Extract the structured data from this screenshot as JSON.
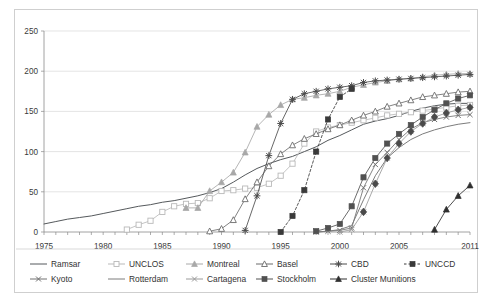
{
  "figure": {
    "background_color": "#ffffff",
    "frame_color": "#cfcfcf",
    "grid_color": "#d9d9d9",
    "axis_color": "#8a8a8a"
  },
  "chart_data": {
    "type": "line",
    "title": "",
    "subtitle": "",
    "xlabel": "",
    "ylabel": "",
    "xlim": [
      1975,
      2011
    ],
    "ylim": [
      0,
      250
    ],
    "ytick_values": [
      0,
      50,
      100,
      150,
      200,
      250
    ],
    "ytick_labels": [
      "0",
      "50",
      "100",
      "150",
      "200",
      "250"
    ],
    "xtick_values": [
      1975,
      1980,
      1985,
      1990,
      1995,
      2000,
      2005,
      2011
    ],
    "xtick_labels": [
      "1975",
      "1980",
      "1985",
      "1990",
      "1995",
      "2000",
      "2005",
      "2011"
    ],
    "grid": "horizontal",
    "legend_position": "bottom",
    "series": [
      {
        "name": "Ramsar",
        "color": "#55595c",
        "marker": "none",
        "dash": "none",
        "x": [
          1975,
          1976,
          1977,
          1978,
          1979,
          1980,
          1981,
          1982,
          1983,
          1984,
          1985,
          1986,
          1987,
          1988,
          1989,
          1990,
          1991,
          1992,
          1993,
          1994,
          1995,
          1996,
          1997,
          1998,
          1999,
          2000,
          2001,
          2002,
          2003,
          2004,
          2005,
          2006,
          2007,
          2008,
          2009,
          2010,
          2011
        ],
        "y": [
          10,
          13,
          16,
          18,
          20,
          23,
          26,
          29,
          32,
          34,
          37,
          39,
          42,
          45,
          49,
          54,
          62,
          71,
          79,
          85,
          90,
          94,
          100,
          106,
          114,
          120,
          127,
          134,
          138,
          141,
          145,
          150,
          154,
          157,
          159,
          160,
          160
        ]
      },
      {
        "name": "UNCLOS",
        "color": "#b9b9b9",
        "marker": "square-open",
        "dash": "none",
        "x": [
          1982,
          1983,
          1984,
          1985,
          1986,
          1987,
          1988,
          1989,
          1990,
          1991,
          1992,
          1993,
          1994,
          1995,
          1996,
          1997,
          1998,
          1999,
          2000,
          2001,
          2002,
          2003,
          2004,
          2005,
          2006,
          2007,
          2008,
          2009,
          2010,
          2011
        ],
        "y": [
          3,
          9,
          14,
          25,
          32,
          35,
          36,
          42,
          51,
          52,
          54,
          55,
          60,
          70,
          85,
          110,
          125,
          130,
          133,
          136,
          139,
          142,
          145,
          147,
          149,
          151,
          153,
          155,
          157,
          158
        ]
      },
      {
        "name": "Montreal",
        "color": "#a8a8a8",
        "marker": "triangle-filled",
        "dash": "none",
        "x": [
          1987,
          1988,
          1989,
          1990,
          1991,
          1992,
          1993,
          1994,
          1995,
          1996,
          1997,
          1998,
          1999,
          2000,
          2001,
          2002,
          2003,
          2004,
          2005,
          2006,
          2007,
          2008,
          2009,
          2010,
          2011
        ],
        "y": [
          30,
          30,
          51,
          62,
          74,
          99,
          131,
          146,
          158,
          165,
          167,
          170,
          172,
          175,
          180,
          183,
          186,
          188,
          190,
          191,
          193,
          195,
          196,
          197,
          197
        ]
      },
      {
        "name": "Basel",
        "color": "#6b6b6b",
        "marker": "triangle-open",
        "dash": "none",
        "x": [
          1989,
          1990,
          1991,
          1992,
          1993,
          1994,
          1995,
          1996,
          1997,
          1998,
          1999,
          2000,
          2001,
          2002,
          2003,
          2004,
          2005,
          2006,
          2007,
          2008,
          2009,
          2010,
          2011
        ],
        "y": [
          1,
          4,
          15,
          41,
          62,
          82,
          97,
          108,
          116,
          122,
          128,
          133,
          139,
          145,
          150,
          156,
          160,
          164,
          168,
          170,
          172,
          174,
          175
        ]
      },
      {
        "name": "CBD",
        "color": "#4b4b4b",
        "marker": "star",
        "dash": "none",
        "x": [
          1992,
          1993,
          1994,
          1995,
          1996,
          1997,
          1998,
          1999,
          2000,
          2001,
          2002,
          2003,
          2004,
          2005,
          2006,
          2007,
          2008,
          2009,
          2010,
          2011
        ],
        "y": [
          2,
          45,
          95,
          135,
          165,
          172,
          175,
          178,
          180,
          182,
          186,
          188,
          189,
          190,
          191,
          192,
          193,
          194,
          195,
          196
        ]
      },
      {
        "name": "UNCCD",
        "color": "#3a3a3a",
        "marker": "square-filled",
        "dash": "dotted",
        "x": [
          1995,
          1996,
          1997,
          1998,
          1999,
          2000,
          2001
        ],
        "y": [
          0,
          20,
          52,
          100,
          140,
          168,
          178
        ]
      },
      {
        "name": "Kyoto",
        "color": "#707070",
        "marker": "x",
        "dash": "none",
        "x": [
          1998,
          1999,
          2000,
          2001,
          2002,
          2003,
          2004,
          2005,
          2006,
          2007,
          2008,
          2009,
          2010,
          2011
        ],
        "y": [
          0,
          1,
          2,
          5,
          55,
          84,
          99,
          115,
          128,
          136,
          140,
          143,
          145,
          146
        ]
      },
      {
        "name": "Rotterdam",
        "color": "#7c7c7c",
        "marker": "none",
        "dash": "none",
        "x": [
          1998,
          1999,
          2000,
          2001,
          2002,
          2003,
          2004,
          2005,
          2006,
          2007,
          2008,
          2009,
          2010,
          2011
        ],
        "y": [
          0,
          1,
          3,
          8,
          40,
          70,
          92,
          105,
          115,
          122,
          127,
          131,
          134,
          136
        ]
      },
      {
        "name": "Cartagena",
        "color": "#9a9a9a",
        "marker": "x",
        "dash": "none",
        "x": [
          2000,
          2001,
          2002,
          2003,
          2004,
          2005,
          2006,
          2007,
          2008,
          2009,
          2010,
          2011
        ],
        "y": [
          0,
          3,
          25,
          60,
          92,
          110,
          125,
          135,
          143,
          148,
          152,
          155
        ]
      },
      {
        "name": "Stockholm",
        "color": "#515151",
        "marker": "square-filled",
        "dash": "none",
        "x": [
          1998,
          1999,
          2000,
          2001,
          2002,
          2003,
          2004,
          2005,
          2006,
          2007,
          2008,
          2009,
          2010,
          2011
        ],
        "y": [
          1,
          5,
          10,
          32,
          68,
          92,
          110,
          122,
          133,
          143,
          152,
          160,
          166,
          170
        ]
      },
      {
        "name": "Cluster Munitions",
        "color": "#2f2f2f",
        "marker": "triangle-filled",
        "dash": "none",
        "x": [
          2008,
          2009,
          2010,
          2011
        ],
        "y": [
          3,
          28,
          45,
          58
        ]
      }
    ],
    "extra_diamond_series": {
      "name": "Cartagena",
      "color": "#4a4a4a",
      "marker": "diamond-filled"
    }
  },
  "legend": {
    "rows": [
      [
        {
          "label": "Ramsar",
          "series": 0
        },
        {
          "label": "UNCLOS",
          "series": 1
        },
        {
          "label": "Montreal",
          "series": 2
        },
        {
          "label": "Basel",
          "series": 3
        },
        {
          "label": "CBD",
          "series": 4
        },
        {
          "label": "UNCCD",
          "series": 5
        }
      ],
      [
        {
          "label": "Kyoto",
          "series": 6
        },
        {
          "label": "Rotterdam",
          "series": 7
        },
        {
          "label": "Cartagena",
          "series": 8
        },
        {
          "label": "Stockholm",
          "series": 9
        },
        {
          "label": "Cluster Munitions",
          "series": 10
        }
      ]
    ]
  }
}
